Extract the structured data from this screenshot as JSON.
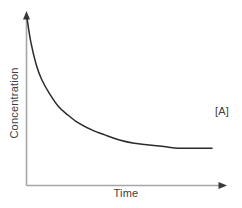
{
  "chart_data": {
    "type": "line",
    "title": "",
    "subtitle": "",
    "xlabel": "Time",
    "ylabel": "Concentration",
    "xlim": [
      0,
      1
    ],
    "ylim": [
      0,
      1
    ],
    "grid": false,
    "legend_position": "right-inline",
    "tick_labels": {
      "x": [],
      "y": []
    },
    "annotations": [
      {
        "name": "series-end-label",
        "text": "[A]",
        "x": 1.0,
        "y": 0.22
      }
    ],
    "series": [
      {
        "name": "[A]",
        "label": "[A]",
        "color": "#2b2b2b",
        "description": "Exponential decay of reactant concentration approaching a plateau",
        "x": [
          0.0,
          0.02,
          0.05,
          0.08,
          0.12,
          0.17,
          0.22,
          0.28,
          0.35,
          0.42,
          0.5,
          0.58,
          0.66,
          0.74,
          0.82,
          0.9,
          1.0
        ],
        "y": [
          1.0,
          0.86,
          0.72,
          0.63,
          0.55,
          0.47,
          0.42,
          0.37,
          0.33,
          0.3,
          0.27,
          0.25,
          0.24,
          0.23,
          0.22,
          0.22,
          0.22
        ]
      }
    ]
  },
  "axes": {
    "x_axis_name": "time-axis",
    "y_axis_name": "concentration-axis",
    "axis_color": "#a6a6a6",
    "arrow_color": "#3a3a3a"
  },
  "labels": {
    "y_axis": "Concentration",
    "x_axis": "Time",
    "series_end": "[A]"
  },
  "colors": {
    "background": "#ffffff",
    "curve": "#2b2b2b",
    "axis": "#a6a6a6",
    "text": "#404040"
  }
}
